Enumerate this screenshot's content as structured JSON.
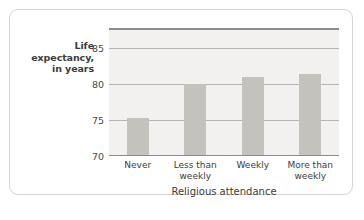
{
  "chart_data": {
    "type": "bar",
    "title": "",
    "subtitle": "",
    "xlabel": "Religious attendance",
    "ylabel": "Life expectancy, in years",
    "ylabel_lines": [
      "Life",
      "expectancy,",
      "in years"
    ],
    "categories": [
      "Never",
      "Less than weekly",
      "Weekly",
      "More than weekly"
    ],
    "category_lines": [
      [
        "Never"
      ],
      [
        "Less than",
        "weekly"
      ],
      [
        "Weekly"
      ],
      [
        "More than",
        "weekly"
      ]
    ],
    "values": [
      75.2,
      79.8,
      80.8,
      81.3
    ],
    "ylim": [
      70,
      87.5
    ],
    "yticks": [
      70,
      75,
      80,
      85
    ],
    "ytick_labels": [
      "70",
      "75",
      "80",
      "85"
    ],
    "grid": true,
    "grid_axis": "y",
    "legend": "none",
    "colors": {
      "bar_fill": "#c4c2bd",
      "plot_background": "#f2f1ef",
      "gridline": "#b6b5b2",
      "axis_line": "#8e8d8a",
      "text": "#3d3d3d",
      "card_border": "#d6d4d1",
      "page_background": "#ffffff"
    }
  }
}
